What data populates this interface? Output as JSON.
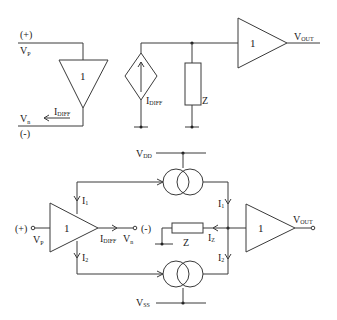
{
  "diagram": {
    "top": {
      "input_plus_label": "(+)",
      "vp_label": "V",
      "vp_sub": "P",
      "vn_label": "V",
      "vn_sub": "n",
      "input_minus_label": "(-)",
      "idiff_label": "I",
      "idiff_sub": "DIFF",
      "input_buffer_gain": "1",
      "source_label": "I",
      "source_sub": "DIFF",
      "impedance_label": "Z",
      "output_buffer_gain": "1",
      "vout_label": "V",
      "vout_sub": "OUT"
    },
    "bottom": {
      "vdd_label": "V",
      "vdd_sub": "DD",
      "vss_label": "V",
      "vss_sub": "SS",
      "input_plus_label": "(+)",
      "vp_label": "V",
      "vp_sub": "P",
      "input_buffer_gain": "1",
      "idiff_label": "I",
      "idiff_sub": "DIFF",
      "vn_label": "V",
      "vn_sub": "n",
      "input_minus_label": "(-)",
      "i1_left_label": "I",
      "i1_left_sub": "1",
      "i2_left_label": "I",
      "i2_left_sub": "2",
      "i1_right_label": "I",
      "i1_right_sub": "1",
      "i2_right_label": "I",
      "i2_right_sub": "2",
      "iz_label": "I",
      "iz_sub": "Z",
      "impedance_label": "Z",
      "output_buffer_gain": "1",
      "vout_label": "V",
      "vout_sub": "OUT"
    }
  }
}
